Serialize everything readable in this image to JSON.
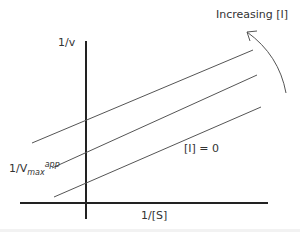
{
  "diagram": {
    "y_axis_label": "1/v",
    "x_axis_label": "1/[S]",
    "intercept_label_main": "1/V",
    "intercept_label_sub": "max",
    "intercept_label_sup": "app",
    "arrow_label": "Increasing [I]",
    "baseline_label": "[I] = 0",
    "colors": {
      "axis": "#222222",
      "line": "#555555",
      "text": "#333333"
    }
  }
}
